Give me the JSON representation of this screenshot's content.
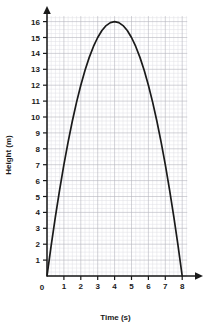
{
  "chart_data": {
    "type": "line",
    "title": "",
    "xlabel": "Time (s)",
    "ylabel": "Height (m)",
    "xlim": [
      0,
      8
    ],
    "ylim": [
      0,
      16
    ],
    "grid": true,
    "grid_major_step_x": 1,
    "grid_major_step_y": 1,
    "grid_minor_divisions": 4,
    "legend": "none",
    "curve_equation": "h = 16 - (t - 4)^2",
    "x_tick_labels": [
      "0",
      "1",
      "2",
      "3",
      "4",
      "5",
      "6",
      "7",
      "8"
    ],
    "y_tick_labels": [
      "1",
      "2",
      "3",
      "4",
      "5",
      "6",
      "7",
      "8",
      "9",
      "10",
      "11",
      "12",
      "13",
      "14",
      "15",
      "16"
    ],
    "origin_label": "0",
    "series": [
      {
        "name": "height",
        "color": "#1a1a1a",
        "x": [
          0,
          0.25,
          0.5,
          0.75,
          1,
          1.25,
          1.5,
          1.75,
          2,
          2.25,
          2.5,
          2.75,
          3,
          3.25,
          3.5,
          3.75,
          4,
          4.25,
          4.5,
          4.75,
          5,
          5.25,
          5.5,
          5.75,
          6,
          6.25,
          6.5,
          6.75,
          7,
          7.25,
          7.5,
          7.75,
          8
        ],
        "y": [
          0,
          1.9375,
          3.75,
          5.4375,
          7,
          8.4375,
          9.75,
          10.9375,
          12,
          12.9375,
          13.75,
          14.4375,
          15,
          15.4375,
          15.75,
          15.9375,
          16,
          15.9375,
          15.75,
          15.4375,
          15,
          14.4375,
          13.75,
          12.9375,
          12,
          10.9375,
          9.75,
          8.4375,
          7,
          5.4375,
          3.75,
          1.9375,
          0
        ]
      }
    ],
    "annotations": {
      "peak_point": [
        4,
        16
      ],
      "start_point": [
        0,
        0
      ],
      "end_point": [
        8,
        0
      ]
    }
  },
  "colors": {
    "curve": "#1a1a1a",
    "axis": "#1a1a1a",
    "grid_major": "#b5b5bd",
    "grid_minor": "#dedee4",
    "background": "#ffffff",
    "text": "#1a1a1a"
  }
}
